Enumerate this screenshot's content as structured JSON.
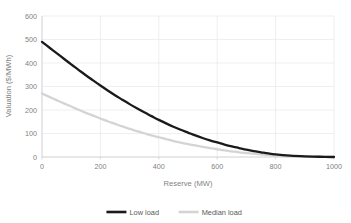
{
  "chart_data": {
    "type": "line",
    "title": "",
    "xlabel": "Reserve (MW)",
    "ylabel": "Valuation ($/MWh)",
    "xlim": [
      0,
      1000
    ],
    "ylim": [
      0,
      600
    ],
    "xticks": [
      0,
      200,
      400,
      600,
      800,
      1000
    ],
    "yticks": [
      0,
      100,
      200,
      300,
      400,
      500,
      600
    ],
    "xtick_labels": [
      "0",
      "200",
      "400",
      "600",
      "800",
      "1000"
    ],
    "ytick_labels": [
      "0",
      "100",
      "200",
      "300",
      "400",
      "500",
      "600"
    ],
    "grid": true,
    "grid_axis": "both",
    "legend_position": "bottom",
    "x": [
      0,
      25,
      50,
      75,
      100,
      125,
      150,
      175,
      200,
      225,
      250,
      275,
      300,
      325,
      350,
      375,
      400,
      425,
      450,
      475,
      500,
      525,
      550,
      575,
      600,
      625,
      650,
      675,
      700,
      725,
      750,
      775,
      800,
      850,
      900,
      950,
      1000
    ],
    "series": [
      {
        "name": "Low load",
        "color": "#1a1a1a",
        "width": 2.3,
        "values": [
          490,
          466,
          442,
          418,
          394,
          371,
          348,
          326,
          304,
          283,
          263,
          244,
          225,
          207,
          190,
          174,
          158,
          143,
          129,
          116,
          104,
          92,
          81,
          71,
          62,
          53,
          45,
          38,
          31,
          25,
          20,
          15,
          11,
          6,
          3,
          1,
          0
        ]
      },
      {
        "name": "Median load",
        "color": "#d4d4d4",
        "width": 2.3,
        "values": [
          270,
          256,
          242,
          228,
          215,
          201,
          188,
          176,
          164,
          152,
          141,
          130,
          120,
          110,
          101,
          92,
          84,
          76,
          68,
          61,
          55,
          49,
          43,
          38,
          33,
          28,
          24,
          20,
          17,
          14,
          11,
          8,
          6,
          3,
          2,
          1,
          0
        ]
      }
    ]
  },
  "legend": {
    "items": [
      {
        "label": "Low load",
        "color": "#1a1a1a",
        "width": 2.6
      },
      {
        "label": "Median load",
        "color": "#d4d4d4",
        "width": 2.6
      }
    ]
  },
  "colors": {
    "grid": "#e8e8e8",
    "axis": "#d0d0d0",
    "tick_text": "#7f7f7f",
    "legend_text": "#595959",
    "background": "#ffffff"
  }
}
